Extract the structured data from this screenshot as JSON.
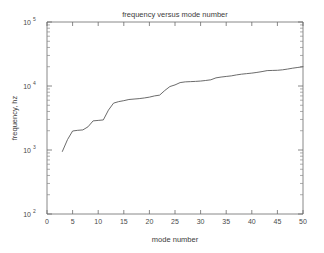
{
  "chart_data": {
    "type": "line",
    "title": "frequency versus mode number",
    "xlabel": "mode number",
    "ylabel": "frequency, hz",
    "xlim": [
      0,
      50
    ],
    "ylim": [
      100,
      100000
    ],
    "yscale": "log",
    "xscale": "linear",
    "grid": false,
    "legend": null,
    "xticks": [
      "0",
      "5",
      "10",
      "15",
      "20",
      "25",
      "30",
      "35",
      "40",
      "45",
      "50"
    ],
    "xtick_values": [
      0,
      5,
      10,
      15,
      20,
      25,
      30,
      35,
      40,
      45,
      50
    ],
    "yticks": [
      "10^2",
      "10^3",
      "10^4",
      "10^5"
    ],
    "ytick_values": [
      100,
      1000,
      10000,
      100000
    ],
    "ytick_base": "10",
    "ytick_exponents": [
      "2",
      "3",
      "4",
      "5"
    ],
    "line_color": "#5a5a5a",
    "series": [
      {
        "name": "frequency",
        "x": [
          3,
          4,
          5,
          6,
          7,
          8,
          9,
          10,
          11,
          12,
          13,
          14,
          15,
          16,
          17,
          18,
          19,
          20,
          21,
          22,
          23,
          24,
          25,
          26,
          27,
          28,
          29,
          30,
          31,
          32,
          33,
          34,
          35,
          36,
          37,
          38,
          39,
          40,
          41,
          42,
          43,
          44,
          45,
          46,
          47,
          48,
          49,
          50
        ],
        "values": [
          950,
          1450,
          1980,
          2030,
          2060,
          2300,
          2850,
          2900,
          2950,
          4200,
          5400,
          5700,
          5900,
          6150,
          6250,
          6350,
          6500,
          6700,
          7000,
          7200,
          8500,
          9800,
          10400,
          11300,
          11600,
          11700,
          11800,
          11950,
          12200,
          12500,
          13400,
          13800,
          14100,
          14400,
          14900,
          15300,
          15600,
          15900,
          16300,
          16800,
          17400,
          17500,
          17600,
          17900,
          18400,
          19000,
          19500,
          20000
        ]
      }
    ]
  },
  "figure": {
    "background_color": "#ffffff",
    "axis_color": "#6b6b6b"
  }
}
